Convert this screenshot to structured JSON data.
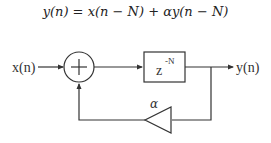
{
  "equation": {
    "text": "y(n) = x(n − N) + αy(n − N)"
  },
  "diagram": {
    "input_label": "x(n)",
    "output_label": "y(n)",
    "adder_symbol": "+",
    "delay_block": {
      "base": "z",
      "exponent": "-N"
    },
    "gain_label": "α",
    "colors": {
      "stroke": "#333333",
      "background": "#ffffff"
    }
  }
}
